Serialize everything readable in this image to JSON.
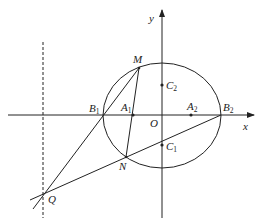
{
  "diagram": {
    "type": "coordinate-geometry",
    "axes": {
      "x_label": "x",
      "y_label": "y",
      "origin_label": "O"
    },
    "points": [
      {
        "name": "M",
        "base": "M",
        "sub": ""
      },
      {
        "name": "N",
        "base": "N",
        "sub": ""
      },
      {
        "name": "Q",
        "base": "Q",
        "sub": ""
      },
      {
        "name": "B1",
        "base": "B",
        "sub": "1"
      },
      {
        "name": "B2",
        "base": "B",
        "sub": "2"
      },
      {
        "name": "A1",
        "base": "A",
        "sub": "1"
      },
      {
        "name": "A2",
        "base": "A",
        "sub": "2"
      },
      {
        "name": "C1",
        "base": "C",
        "sub": "1"
      },
      {
        "name": "C2",
        "base": "C",
        "sub": "2"
      }
    ],
    "elements": [
      "circle through B1, B2, M, N",
      "line Q-M through B1",
      "line Q-B2 through N and C1",
      "segment M-N through A1",
      "dashed vertical line through Q"
    ],
    "colors": {
      "stroke": "#222222",
      "background": "#ffffff"
    }
  }
}
